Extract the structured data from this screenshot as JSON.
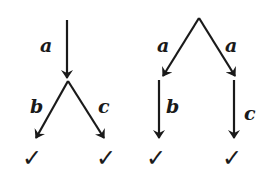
{
  "diagram": {
    "colors": {
      "ink": "#1a1a1a",
      "background": "#ffffff"
    },
    "left_tree": {
      "edges": [
        {
          "label": "a",
          "from": [
            67,
            20
          ],
          "to": [
            67,
            78
          ]
        },
        {
          "label": "b",
          "from": [
            68,
            81
          ],
          "to": [
            36,
            138
          ]
        },
        {
          "label": "c",
          "from": [
            68,
            81
          ],
          "to": [
            104,
            138
          ]
        }
      ],
      "labels": [
        {
          "text": "a",
          "x": 40,
          "y": 52
        },
        {
          "text": "b",
          "x": 30,
          "y": 113
        },
        {
          "text": "c",
          "x": 98,
          "y": 113
        }
      ],
      "terminals": [
        {
          "text": "✓",
          "x": 22,
          "y": 166
        },
        {
          "text": "✓",
          "x": 96,
          "y": 166
        }
      ]
    },
    "right_tree": {
      "edges": [
        {
          "label": "a",
          "from": [
            199,
            18
          ],
          "to": [
            163,
            76
          ]
        },
        {
          "label": "a",
          "from": [
            199,
            18
          ],
          "to": [
            235,
            76
          ]
        },
        {
          "label": "b",
          "from": [
            159,
            80
          ],
          "to": [
            159,
            138
          ]
        },
        {
          "label": "c",
          "from": [
            234,
            80
          ],
          "to": [
            234,
            138
          ]
        }
      ],
      "labels": [
        {
          "text": "a",
          "x": 157,
          "y": 52
        },
        {
          "text": "a",
          "x": 225,
          "y": 52
        },
        {
          "text": "b",
          "x": 166,
          "y": 113
        },
        {
          "text": "c",
          "x": 244,
          "y": 120
        }
      ],
      "terminals": [
        {
          "text": "✓",
          "x": 146,
          "y": 166
        },
        {
          "text": "✓",
          "x": 222,
          "y": 166
        }
      ]
    }
  }
}
